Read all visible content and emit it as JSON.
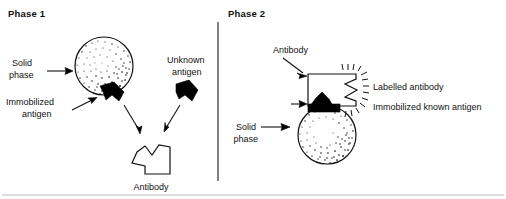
{
  "figure": {
    "background_color": "#ffffff",
    "ink_color": "#111111",
    "divider_color": "#1a1a1a",
    "bottom_rule_color": "#b9b9b9"
  },
  "phase1": {
    "title": "Phase 1",
    "labels": {
      "solid_phase_line1": "Solid",
      "solid_phase_line2": "phase",
      "immobilized_line1": "Immobilized",
      "immobilized_line2": "antigen",
      "unknown_line1": "Unknown",
      "unknown_line2": "antigen",
      "antibody": "Antibody"
    },
    "shapes": {
      "sphere_name": "solid-phase-sphere",
      "immobilized_antigen_name": "immobilized-antigen-wedge",
      "unknown_antigen_name": "unknown-antigen-wedge",
      "antibody_name": "antibody-polygon"
    }
  },
  "phase2": {
    "title": "Phase 2",
    "labels": {
      "antibody": "Antibody",
      "solid_phase_line1": "Solid",
      "solid_phase_line2": "phase",
      "legend_labelled_antibody": "Labelled antibody",
      "legend_immobilized_known_antigen": "Immobilized known antigen"
    },
    "shapes": {
      "sphere_name": "solid-phase-sphere",
      "labelled_antibody_name": "labelled-antibody-box",
      "bound_antigen_name": "bound-antigen-wedge",
      "sparkle_name": "label-emission-rays"
    }
  }
}
